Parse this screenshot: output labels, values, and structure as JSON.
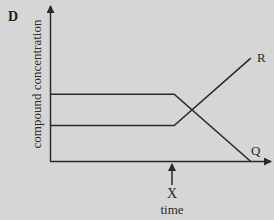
{
  "panel": {
    "label": "D"
  },
  "colors": {
    "background": "#d6d6d6",
    "line": "#2a2a2a"
  },
  "chart_data": {
    "type": "line",
    "title": "",
    "panel_label": "D",
    "xlabel": "time",
    "ylabel": "compound concentration",
    "x_ticks": [],
    "y_ticks": [],
    "grid": false,
    "legend": "none (series labelled directly at line ends)",
    "annotations": [
      {
        "label": "X",
        "type": "arrow",
        "x": 0.6,
        "points_to": "x-axis",
        "description": "time point X where concentrations begin to change"
      }
    ],
    "xlim": [
      0,
      1
    ],
    "ylim": [
      0,
      1
    ],
    "series": [
      {
        "name": "R",
        "x": [
          0,
          0.6,
          0.97
        ],
        "y": [
          0.23,
          0.23,
          0.66
        ],
        "description": "constant low until X, then increases steadily"
      },
      {
        "name": "Q",
        "x": [
          0,
          0.6,
          0.97
        ],
        "y": [
          0.43,
          0.43,
          0.0
        ],
        "description": "constant high until X, then decreases to zero"
      }
    ]
  },
  "labels": {
    "ylabel": "compound concentration",
    "xlabel": "time",
    "marker": "X",
    "series_R": "R",
    "series_Q": "Q"
  }
}
